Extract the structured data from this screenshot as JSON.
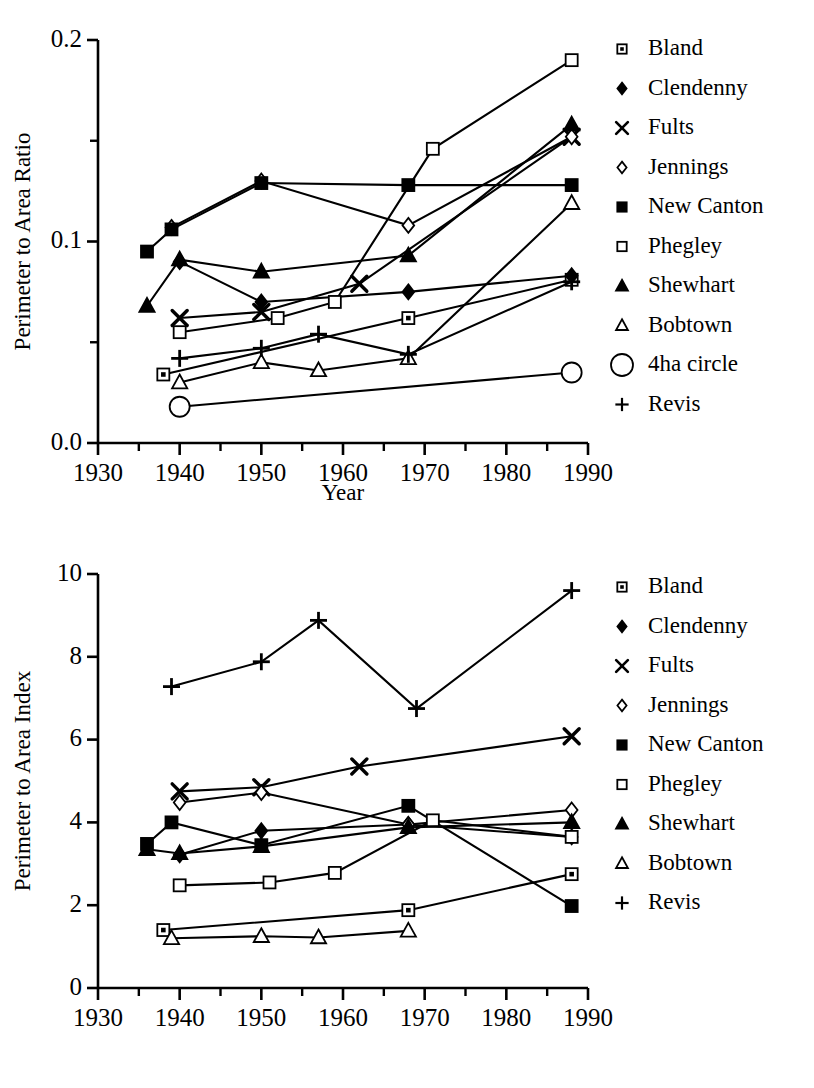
{
  "figure": {
    "title": "",
    "panels": [
      "top",
      "bottom"
    ]
  },
  "chart_data": [
    {
      "id": "top",
      "type": "line",
      "title": "",
      "xlabel": "Year",
      "ylabel": "Perimeter to Area Ratio",
      "xlim": [
        1930,
        1990
      ],
      "ylim": [
        0.0,
        0.2
      ],
      "xticks": [
        1930,
        1940,
        1950,
        1960,
        1970,
        1980,
        1990
      ],
      "xticklabels": [
        "1930",
        "1940",
        "1950",
        "1960",
        "1970",
        "1980",
        "1990"
      ],
      "xminorticks": [
        1935,
        1945,
        1955,
        1965,
        1975,
        1985
      ],
      "yticks": [
        0.0,
        0.1,
        0.2
      ],
      "yticklabels": [
        "0.0",
        "0.1",
        "0.2"
      ],
      "yminorticks": [
        0.05,
        0.15
      ],
      "grid": false,
      "legend_position": "right",
      "series": [
        {
          "name": "Bland",
          "marker": "square-dotted",
          "x": [
            1938,
            1968,
            1988
          ],
          "y": [
            0.034,
            0.062,
            0.081
          ]
        },
        {
          "name": "Clendenny",
          "marker": "diamond-filled",
          "x": [
            1940,
            1950,
            1968,
            1988
          ],
          "y": [
            0.09,
            0.07,
            0.075,
            0.083
          ]
        },
        {
          "name": "Fults",
          "marker": "cross-x",
          "x": [
            1940,
            1950,
            1962,
            1988
          ],
          "y": [
            0.062,
            0.065,
            0.079,
            0.152
          ]
        },
        {
          "name": "Jennings",
          "marker": "diamond-open",
          "x": [
            1939,
            1950,
            1968,
            1988
          ],
          "y": [
            0.107,
            0.13,
            0.108,
            0.152
          ]
        },
        {
          "name": "New Canton",
          "marker": "square-filled",
          "x": [
            1936,
            1939,
            1950,
            1968,
            1988
          ],
          "y": [
            0.095,
            0.106,
            0.129,
            0.128,
            0.128
          ]
        },
        {
          "name": "Phegley",
          "marker": "square-open",
          "x": [
            1940,
            1952,
            1959,
            1971,
            1988
          ],
          "y": [
            0.055,
            0.062,
            0.07,
            0.146,
            0.19
          ]
        },
        {
          "name": "Shewhart",
          "marker": "triangle-filled",
          "x": [
            1936,
            1940,
            1950,
            1968,
            1988
          ],
          "y": [
            0.068,
            0.091,
            0.085,
            0.093,
            0.158
          ]
        },
        {
          "name": "Bobtown",
          "marker": "triangle-open",
          "x": [
            1940,
            1950,
            1957,
            1968,
            1988
          ],
          "y": [
            0.03,
            0.04,
            0.036,
            0.042,
            0.119
          ]
        },
        {
          "name": "4ha circle",
          "marker": "circle-open",
          "x": [
            1940,
            1988
          ],
          "y": [
            0.018,
            0.035
          ]
        },
        {
          "name": "Revis",
          "marker": "plus",
          "x": [
            1940,
            1950,
            1957,
            1968,
            1988
          ],
          "y": [
            0.042,
            0.047,
            0.054,
            0.044,
            0.08
          ]
        }
      ],
      "legend": [
        {
          "label": "Bland",
          "marker": "square-dotted"
        },
        {
          "label": "Clendenny",
          "marker": "diamond-filled"
        },
        {
          "label": "Fults",
          "marker": "cross-x"
        },
        {
          "label": "Jennings",
          "marker": "diamond-open"
        },
        {
          "label": "New Canton",
          "marker": "square-filled"
        },
        {
          "label": "Phegley",
          "marker": "square-open"
        },
        {
          "label": "Shewhart",
          "marker": "triangle-filled"
        },
        {
          "label": "Bobtown",
          "marker": "triangle-open"
        },
        {
          "label": "4ha circle",
          "marker": "circle-open-large"
        },
        {
          "label": "Revis",
          "marker": "plus"
        }
      ]
    },
    {
      "id": "bottom",
      "type": "line",
      "title": "",
      "xlabel": "",
      "ylabel": "Perimeter to Area Index",
      "xlim": [
        1930,
        1990
      ],
      "ylim": [
        0,
        10
      ],
      "xticks": [
        1930,
        1940,
        1950,
        1960,
        1970,
        1980,
        1990
      ],
      "xticklabels": [
        "1930",
        "1940",
        "1950",
        "1960",
        "1970",
        "1980",
        "1990"
      ],
      "xminorticks": [
        1935,
        1945,
        1955,
        1965,
        1975,
        1985
      ],
      "yticks": [
        0,
        2,
        4,
        6,
        8,
        10
      ],
      "yticklabels": [
        "0",
        "2",
        "4",
        "6",
        "8",
        "10"
      ],
      "yminorticks": [],
      "grid": false,
      "legend_position": "right",
      "series": [
        {
          "name": "Bland",
          "marker": "square-dotted",
          "x": [
            1938,
            1968,
            1988
          ],
          "y": [
            1.4,
            1.88,
            2.75
          ]
        },
        {
          "name": "Clendenny",
          "marker": "diamond-filled",
          "x": [
            1940,
            1950,
            1968,
            1988
          ],
          "y": [
            3.22,
            3.8,
            3.95,
            3.65
          ]
        },
        {
          "name": "Fults",
          "marker": "cross-x",
          "x": [
            1940,
            1950,
            1962,
            1988
          ],
          "y": [
            4.75,
            4.85,
            5.35,
            6.08
          ]
        },
        {
          "name": "Jennings",
          "marker": "diamond-open",
          "x": [
            1940,
            1950,
            1968,
            1988
          ],
          "y": [
            4.48,
            4.72,
            3.95,
            4.3
          ]
        },
        {
          "name": "New Canton",
          "marker": "square-filled",
          "x": [
            1936,
            1939,
            1950,
            1968,
            1988
          ],
          "y": [
            3.48,
            4.0,
            3.45,
            4.4,
            1.98
          ]
        },
        {
          "name": "Phegley",
          "marker": "square-open",
          "x": [
            1940,
            1951,
            1959,
            1971,
            1988
          ],
          "y": [
            2.48,
            2.55,
            2.78,
            4.05,
            3.65
          ]
        },
        {
          "name": "Shewhart",
          "marker": "triangle-filled",
          "x": [
            1936,
            1940,
            1950,
            1968,
            1988
          ],
          "y": [
            3.35,
            3.25,
            3.42,
            3.88,
            4.0
          ]
        },
        {
          "name": "Bobtown",
          "marker": "triangle-open",
          "x": [
            1939,
            1950,
            1957,
            1968
          ],
          "y": [
            1.2,
            1.25,
            1.22,
            1.38
          ]
        },
        {
          "name": "Revis",
          "marker": "plus",
          "x": [
            1939,
            1950,
            1957,
            1969,
            1988
          ],
          "y": [
            7.28,
            7.88,
            8.88,
            6.75,
            9.6
          ]
        }
      ],
      "legend": [
        {
          "label": "Bland",
          "marker": "square-dotted"
        },
        {
          "label": "Clendenny",
          "marker": "diamond-filled"
        },
        {
          "label": "Fults",
          "marker": "cross-x"
        },
        {
          "label": "Jennings",
          "marker": "diamond-open"
        },
        {
          "label": "New Canton",
          "marker": "square-filled"
        },
        {
          "label": "Phegley",
          "marker": "square-open"
        },
        {
          "label": "Shewhart",
          "marker": "triangle-filled"
        },
        {
          "label": "Bobtown",
          "marker": "triangle-open"
        },
        {
          "label": "Revis",
          "marker": "plus"
        }
      ]
    }
  ],
  "colors": {
    "ink": "#000000",
    "paper": "#ffffff"
  }
}
